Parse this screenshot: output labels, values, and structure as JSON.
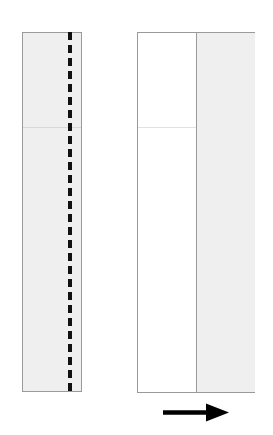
{
  "diagram": {
    "background_color": "#ffffff",
    "paper_fill": "#efefef",
    "paper_white_fill": "#ffffff",
    "outline_color": "#9a9a9a",
    "fold_line_color": "#111111",
    "crease_color": "#d8d8d8",
    "arrow_color": "#000000"
  },
  "left_figure": {
    "name": "unfolded-strip",
    "description": "Tall narrow vertical strip of paper, shaded light gray, with a bold dashed vertical fold line near its right side and a faint horizontal crease across the upper quarter.",
    "x": 22,
    "y": 32,
    "width": 60,
    "height": 360,
    "fill": "#efefef",
    "fold_line": {
      "name": "valley-fold-line",
      "orientation": "vertical",
      "style": "dashed",
      "x_offset": 46,
      "color": "#111111",
      "dash_length": 8,
      "gap_length": 5,
      "thickness": 4
    },
    "crease": {
      "name": "horizontal-crease",
      "orientation": "horizontal",
      "y_offset": 94,
      "color": "#d8d8d8"
    }
  },
  "right_figure": {
    "name": "folded-strip",
    "description": "Result of the fold: a wider rectangle whose left half is white (back of paper) and whose right half is shaded light gray, separated by a vertical fold edge.",
    "x": 137,
    "y": 32,
    "width": 118,
    "height": 361,
    "left_half_fill": "#ffffff",
    "right_half_fill": "#efefef",
    "divider": {
      "name": "fold-edge",
      "orientation": "vertical",
      "x_offset": 59,
      "color": "#9a9a9a"
    },
    "crease": {
      "name": "horizontal-crease",
      "orientation": "horizontal",
      "y_offset": 94,
      "color": "#e2e2e2"
    }
  },
  "arrow": {
    "name": "step-direction-arrow",
    "direction": "right",
    "x": 163,
    "y": 412,
    "length": 66,
    "shaft_thickness": 4,
    "head_width": 22,
    "head_height": 18,
    "color": "#000000"
  }
}
